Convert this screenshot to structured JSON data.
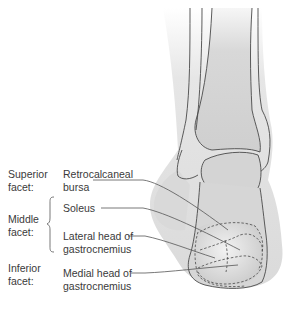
{
  "figure": {
    "colors": {
      "background": "#ffffff",
      "soft_tissue": "#d9d9d9",
      "bone": "#cdcdcd",
      "outline": "#4a4a4a",
      "leader_line": "#555555",
      "text": "#3a3a3a"
    }
  },
  "facets": [
    {
      "id": "superior",
      "label_line1": "Superior",
      "label_line2": "facet:"
    },
    {
      "id": "middle",
      "label_line1": "Middle",
      "label_line2": "facet:"
    },
    {
      "id": "inferior",
      "label_line1": "Inferior",
      "label_line2": "facet:"
    }
  ],
  "structures": [
    {
      "id": "retrocalcaneal-bursa",
      "facet": "superior",
      "label_line1": "Retrocalcaneal",
      "label_line2": "bursa"
    },
    {
      "id": "soleus",
      "facet": "middle",
      "label_line1": "Soleus",
      "label_line2": ""
    },
    {
      "id": "lateral-gastrocnemius",
      "facet": "middle",
      "label_line1": "Lateral head of",
      "label_line2": "gastrocnemius"
    },
    {
      "id": "medial-gastrocnemius",
      "facet": "inferior",
      "label_line1": "Medial head of",
      "label_line2": "gastrocnemius"
    }
  ]
}
